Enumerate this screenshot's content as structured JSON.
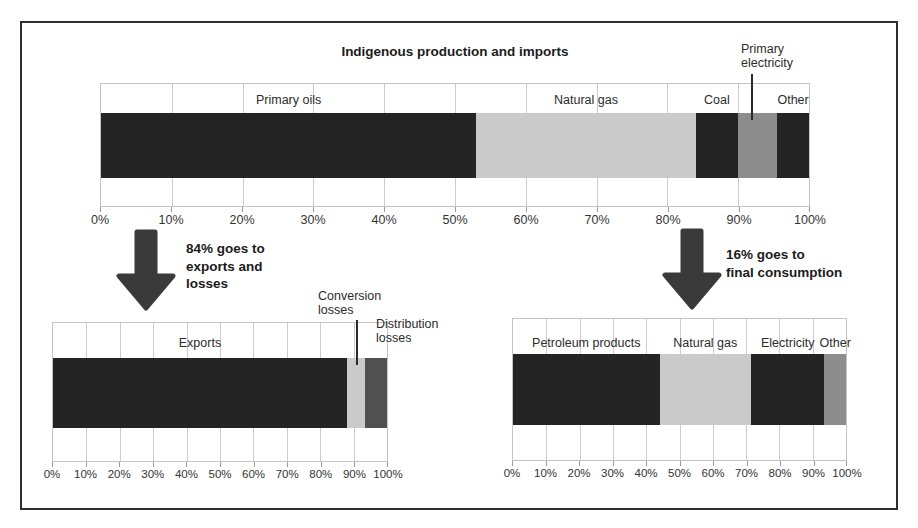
{
  "colors": {
    "dark": "#242424",
    "light_gray": "#cacaca",
    "medium_gray": "#8d8d8d",
    "dark_gray": "#505050",
    "arrow": "#3a3a3a",
    "grid": "#cccccc"
  },
  "annotations": {
    "left": {
      "lines": [
        "84% goes to",
        "exports and",
        "losses"
      ]
    },
    "right": {
      "lines": [
        "16% goes to",
        "final consumption"
      ]
    }
  },
  "chart_data": [
    {
      "type": "bar",
      "orientation": "horizontal-stacked",
      "title": "Indigenous production and imports",
      "unit": "%",
      "xlim": [
        0,
        100
      ],
      "tick_labels": [
        "0%",
        "10%",
        "20%",
        "30%",
        "40%",
        "50%",
        "60%",
        "70%",
        "80%",
        "90%",
        "100%"
      ],
      "segments": [
        {
          "label": "Primary oils",
          "value": 53,
          "color": "dark",
          "label_placement": "inside"
        },
        {
          "label": "Natural gas",
          "value": 31,
          "color": "light_gray",
          "label_placement": "inside"
        },
        {
          "label": "Coal",
          "value": 6,
          "color": "dark",
          "label_placement": "inside"
        },
        {
          "label": "Primary electricity",
          "value": 5.5,
          "color": "medium_gray",
          "label_placement": "outside"
        },
        {
          "label": "Other",
          "value": 4.5,
          "color": "dark",
          "label_placement": "inside"
        }
      ]
    },
    {
      "type": "bar",
      "orientation": "horizontal-stacked",
      "annotation": "84% goes to exports and losses",
      "unit": "%",
      "xlim": [
        0,
        100
      ],
      "tick_labels": [
        "0%",
        "10%",
        "20%",
        "30%",
        "40%",
        "50%",
        "60%",
        "70%",
        "80%",
        "90%",
        "100%"
      ],
      "segments": [
        {
          "label": "Exports",
          "value": 88,
          "color": "dark",
          "label_placement": "inside"
        },
        {
          "label": "Conversion losses",
          "value": 5.5,
          "color": "light_gray",
          "label_placement": "outside"
        },
        {
          "label": "Distribution losses",
          "value": 6.5,
          "color": "dark_gray",
          "label_placement": "outside"
        }
      ]
    },
    {
      "type": "bar",
      "orientation": "horizontal-stacked",
      "annotation": "16% goes to final consumption",
      "unit": "%",
      "xlim": [
        0,
        100
      ],
      "tick_labels": [
        "0%",
        "10%",
        "20%",
        "30%",
        "40%",
        "50%",
        "60%",
        "70%",
        "80%",
        "90%",
        "100%"
      ],
      "segments": [
        {
          "label": "Petroleum products",
          "value": 44,
          "color": "dark",
          "label_placement": "inside"
        },
        {
          "label": "Natural gas",
          "value": 27.5,
          "color": "light_gray",
          "label_placement": "inside"
        },
        {
          "label": "Electricity",
          "value": 22,
          "color": "dark",
          "label_placement": "inside"
        },
        {
          "label": "Other",
          "value": 6.5,
          "color": "medium_gray",
          "label_placement": "inside"
        }
      ]
    }
  ]
}
